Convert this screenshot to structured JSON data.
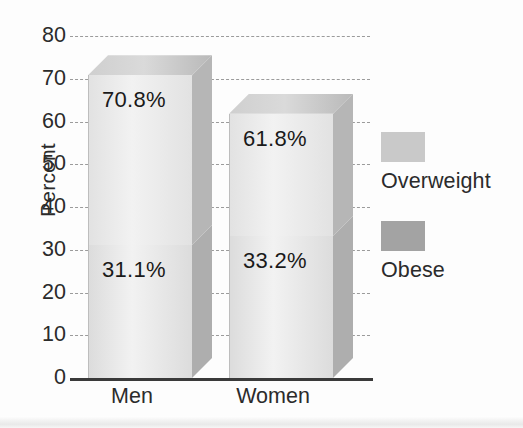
{
  "chart_data": {
    "type": "bar",
    "subtype": "stacked-3d-column",
    "title": "",
    "xlabel": "",
    "ylabel": "Percent",
    "categories": [
      "Men",
      "Women"
    ],
    "series": [
      {
        "name": "Overweight",
        "values": [
          70.8,
          61.8
        ],
        "color": "#c9c9c9"
      },
      {
        "name": "Obese",
        "values": [
          31.1,
          33.2
        ],
        "color": "#a3a3a3"
      }
    ],
    "data_labels": [
      {
        "category": "Men",
        "series": "Overweight",
        "text": "70.8%",
        "value": 70.8
      },
      {
        "category": "Men",
        "series": "Obese",
        "text": "31.1%",
        "value": 31.1
      },
      {
        "category": "Women",
        "series": "Overweight",
        "text": "61.8%",
        "value": 61.8
      },
      {
        "category": "Women",
        "series": "Obese",
        "text": "33.2%",
        "value": 33.2
      }
    ],
    "ylim": [
      0,
      80
    ],
    "yticks": [
      "0",
      "10",
      "20",
      "30",
      "40",
      "50",
      "60",
      "70",
      "80"
    ],
    "grid": "horizontal-dashed",
    "legend_position": "right",
    "legend": [
      "Overweight",
      "Obese"
    ]
  },
  "axis": {
    "y_title": "Percent",
    "ticks": [
      {
        "label": "80",
        "value": 80
      },
      {
        "label": "70",
        "value": 70
      },
      {
        "label": "60",
        "value": 60
      },
      {
        "label": "50",
        "value": 50
      },
      {
        "label": "40",
        "value": 40
      },
      {
        "label": "30",
        "value": 30
      },
      {
        "label": "20",
        "value": 20
      },
      {
        "label": "10",
        "value": 10
      },
      {
        "label": "0",
        "value": 0
      }
    ],
    "x_categories": [
      {
        "label": "Men"
      },
      {
        "label": "Women"
      }
    ]
  },
  "bars": [
    {
      "category": "Men",
      "overweight_label": "70.8%",
      "obese_label": "31.1%",
      "overweight_top": 70.8,
      "obese_top": 31.1
    },
    {
      "category": "Women",
      "overweight_label": "61.8%",
      "obese_label": "33.2%",
      "overweight_top": 61.8,
      "obese_top": 33.2
    }
  ],
  "legend": {
    "entries": [
      {
        "label": "Overweight",
        "color": "#c9c9c9"
      },
      {
        "label": "Obese",
        "color": "#a3a3a3"
      }
    ]
  },
  "colors": {
    "overweight_face": "#e2e2e2",
    "overweight_side": "#b6b6b6",
    "overweight_top": "#cfcfcf",
    "obese_face": "#dcdcdc",
    "obese_side": "#aeaeae",
    "legend_overweight": "#c9c9c9",
    "legend_obese": "#a3a3a3",
    "gridline": "#9b9b9b",
    "axis": "#3a3a3a",
    "text": "#2b2b2b"
  }
}
